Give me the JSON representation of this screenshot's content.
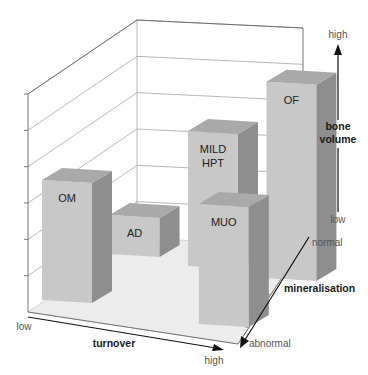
{
  "chart_data": {
    "type": "bar3d",
    "title": "",
    "axes": {
      "x": {
        "title": "turnover",
        "low_label": "low",
        "high_label": "high"
      },
      "y": {
        "title_lines": [
          "bone",
          "volume"
        ],
        "low_label": "low",
        "high_label": "high"
      },
      "z": {
        "title": "mineralisation",
        "near_label": "abnormal",
        "far_label": "normal"
      }
    },
    "bars": [
      {
        "label_lines": [
          "OF"
        ],
        "turnover": "high",
        "mineralisation": "normal",
        "bone_volume": 0.9
      },
      {
        "label_lines": [
          "MILD",
          "HPT"
        ],
        "turnover": "medium",
        "mineralisation": "normal",
        "bone_volume": 0.62
      },
      {
        "label_lines": [
          "OM"
        ],
        "turnover": "low",
        "mineralisation": "abnormal",
        "bone_volume": 0.55
      },
      {
        "label_lines": [
          "MUO"
        ],
        "turnover": "high",
        "mineralisation": "abnormal",
        "bone_volume": 0.55
      },
      {
        "label_lines": [
          "AD"
        ],
        "turnover": "low",
        "mineralisation": "normal",
        "bone_volume": 0.18
      }
    ],
    "colors": {
      "front": "#c8c8c8",
      "side": "#8e8e8e",
      "top": "#a9a9a9",
      "floor": "#ececec",
      "gridline": "#9a9a9a"
    },
    "grid": true
  }
}
